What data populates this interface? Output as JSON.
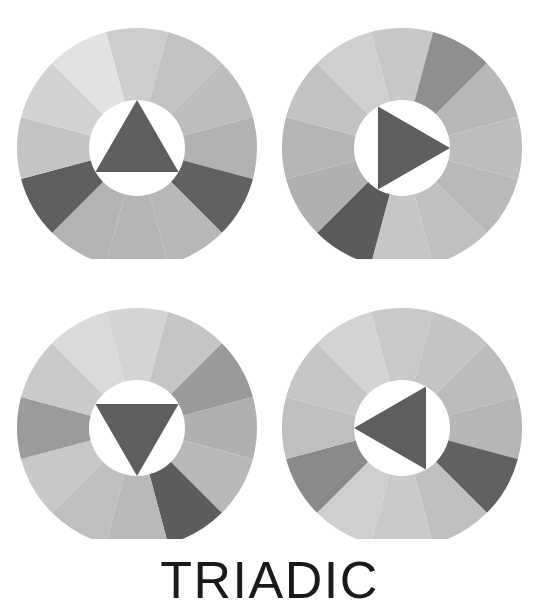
{
  "caption": {
    "label": "TRIADIC"
  },
  "figure": {
    "title": "TRIADIC",
    "background_color": "#ffffff",
    "wheel_count": 4,
    "segments_per_wheel": 12,
    "inner_circle_color": "#ffffff",
    "triangle_color": "#5e5e5e"
  },
  "chart_data": {
    "type": "pie",
    "title": "TRIADIC",
    "xlabel": "",
    "ylabel": "",
    "legend": "none",
    "grid": false,
    "note": "Four 12-segment grayscale colour wheels, each overlaid with an equilateral triangle marking a triadic harmony (three hues 120 degrees apart). Each wheel is rotated so the triangle points in a different direction.",
    "categories": [
      "seg-1",
      "seg-2",
      "seg-3",
      "seg-4",
      "seg-5",
      "seg-6",
      "seg-7",
      "seg-8",
      "seg-9",
      "seg-10",
      "seg-11",
      "seg-12"
    ],
    "values": [
      30,
      30,
      30,
      30,
      30,
      30,
      30,
      30,
      30,
      30,
      30,
      30
    ],
    "series": [
      {
        "name": "wheel-top-left",
        "triangle_direction": "up",
        "triangle_rotation_deg": 0,
        "center": [
          123,
          134
        ],
        "outer_radius": 120,
        "inner_radius": 48,
        "segment_colors": [
          "#cdcdcd",
          "#c3c3c3",
          "#bdbdbd",
          "#b2b2b2",
          "#616161",
          "#b7b7b7",
          "#b5b5b5",
          "#b3b3b3",
          "#5e5e5e",
          "#c4c4c4",
          "#d2d2d2",
          "#e2e2e2"
        ]
      },
      {
        "name": "wheel-top-right",
        "triangle_direction": "right",
        "triangle_rotation_deg": 90,
        "center": [
          123,
          134
        ],
        "outer_radius": 120,
        "inner_radius": 48,
        "segment_colors": [
          "#c7c7c7",
          "#8f8f8f",
          "#b8b8b8",
          "#bdbdbd",
          "#b9b9b9",
          "#c0c0c0",
          "#c6c6c6",
          "#5b5b5b",
          "#b0b0b0",
          "#b5b5b5",
          "#c2c2c2",
          "#cfcfcf"
        ]
      },
      {
        "name": "wheel-bottom-left",
        "triangle_direction": "down",
        "triangle_rotation_deg": 180,
        "center": [
          123,
          134
        ],
        "outer_radius": 120,
        "inner_radius": 48,
        "segment_colors": [
          "#d4d4d4",
          "#c5c5c5",
          "#9a9a9a",
          "#b0b0b0",
          "#b8b8b8",
          "#5c5c5c",
          "#b9b9b9",
          "#bfbfbf",
          "#c8c8c8",
          "#9b9b9b",
          "#cacaca",
          "#dadada"
        ]
      },
      {
        "name": "wheel-bottom-right",
        "triangle_direction": "left",
        "triangle_rotation_deg": 270,
        "center": [
          123,
          134
        ],
        "outer_radius": 120,
        "inner_radius": 48,
        "segment_colors": [
          "#c9c9c9",
          "#c4c4c4",
          "#bcbcbc",
          "#b6b6b6",
          "#616161",
          "#c0c0c0",
          "#cacaca",
          "#cfcfcf",
          "#8a8a8a",
          "#bfbfbf",
          "#c6c6c6",
          "#d3d3d3"
        ]
      }
    ]
  }
}
